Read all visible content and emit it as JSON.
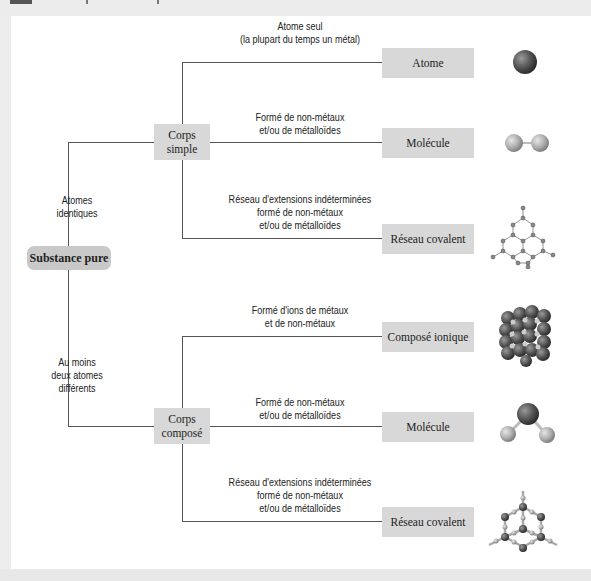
{
  "diagram": {
    "root": {
      "label": "Substance pure"
    },
    "branches": [
      {
        "edge_label": [
          "Atomes",
          "identiques"
        ],
        "node": {
          "label": [
            "Corps",
            "simple"
          ]
        },
        "children": [
          {
            "edge_label": [
              "Atome seul",
              "(la plupart du temps un métal)"
            ],
            "result": "Atome",
            "icon": "single-atom-icon"
          },
          {
            "edge_label": [
              "Formé de non-métaux",
              "et/ou de métalloïdes"
            ],
            "result": "Molécule",
            "icon": "diatomic-molecule-icon"
          },
          {
            "edge_label": [
              "Réseau d'extensions indéterminées",
              "formé de non-métaux",
              "et/ou de métalloïdes"
            ],
            "result": "Réseau covalent",
            "icon": "covalent-network-icon"
          }
        ]
      },
      {
        "edge_label": [
          "Au moins",
          "deux atomes",
          "différents"
        ],
        "node": {
          "label": [
            "Corps",
            "composé"
          ]
        },
        "children": [
          {
            "edge_label": [
              "Formé d'ions de métaux",
              "et de non-métaux"
            ],
            "result": "Composé ionique",
            "icon": "ionic-lattice-icon"
          },
          {
            "edge_label": [
              "Formé de non-métaux",
              "et/ou de métalloïdes"
            ],
            "result": "Molécule",
            "icon": "bent-molecule-icon"
          },
          {
            "edge_label": [
              "Réseau d'extensions indéterminées",
              "formé de non-métaux",
              "et/ou de métalloïdes"
            ],
            "result": "Réseau covalent",
            "icon": "compound-network-icon"
          }
        ]
      }
    ],
    "colors": {
      "box_fill": "#d8d8d8",
      "root_fill": "#c9c9c9",
      "line": "#555555",
      "background": "#ffffff"
    }
  }
}
